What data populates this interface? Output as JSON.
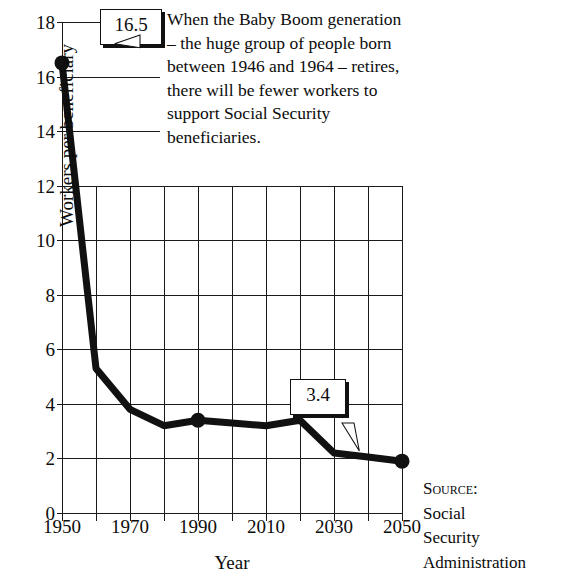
{
  "top_fragment": "...",
  "description": "When the Baby Boom generation – the huge group of people born between 1946 and 1964 – retires, there will be fewer workers  to support Social Security beneficiaries.",
  "source": {
    "label": "Source:",
    "line1": "Social",
    "line2": "Security",
    "line3": "Administration"
  },
  "callouts": [
    {
      "value": "16.5",
      "year": 1950
    },
    {
      "value": "3.4",
      "year": 1990
    },
    {
      "value": "1.9",
      "year": 2050
    }
  ],
  "chart_data": {
    "type": "line",
    "title": "",
    "xlabel": "Year",
    "ylabel": "Workers per beneficiary",
    "xlim": [
      1950,
      2050
    ],
    "ylim": [
      0,
      18
    ],
    "grid": true,
    "legend": false,
    "x_ticks": [
      1950,
      1960,
      1970,
      1980,
      1990,
      2000,
      2010,
      2020,
      2030,
      2040,
      2050
    ],
    "x_tick_labels": [
      "1950",
      "",
      "1970",
      "",
      "1990",
      "",
      "2010",
      "",
      "2030",
      "",
      "2050"
    ],
    "y_ticks": [
      0,
      2,
      4,
      6,
      8,
      10,
      12,
      14,
      16,
      18
    ],
    "y_tick_labels": [
      "0",
      "2",
      "4",
      "6",
      "8",
      "10",
      "12",
      "14",
      "16",
      "18"
    ],
    "x": [
      1950,
      1960,
      1970,
      1980,
      1990,
      2000,
      2010,
      2020,
      2030,
      2040,
      2050
    ],
    "values": [
      16.5,
      5.3,
      3.8,
      3.2,
      3.4,
      3.3,
      3.2,
      3.4,
      2.2,
      2.05,
      1.9
    ],
    "markers": [
      {
        "x": 1950,
        "y": 16.5
      },
      {
        "x": 1990,
        "y": 3.4
      },
      {
        "x": 2050,
        "y": 1.9
      }
    ],
    "data_labels": [
      "16.5",
      "3.4",
      "1.9"
    ],
    "line_color": "#111111",
    "line_width": 7
  }
}
